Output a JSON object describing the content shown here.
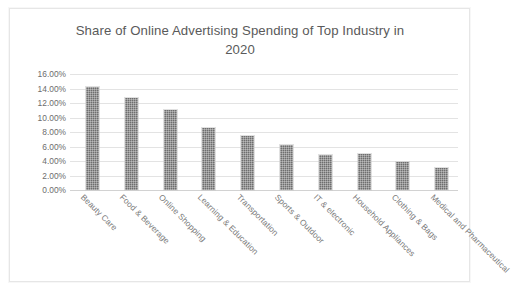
{
  "chart_data": {
    "type": "bar",
    "title": "Share of Online Advertising Spending of Top Industry in 2020",
    "title_line1": "Share of Online Advertising Spending of Top Industry in",
    "title_line2": "2020",
    "xlabel": "",
    "ylabel": "",
    "ylim": [
      0,
      16
    ],
    "ytick_labels": [
      "16.00%",
      "14.00%",
      "12.00%",
      "10.00%",
      "8.00%",
      "6.00%",
      "4.00%",
      "2.00%",
      "0.00%"
    ],
    "ytick_values": [
      16,
      14,
      12,
      10,
      8,
      6,
      4,
      2,
      0
    ],
    "grid": true,
    "legend": "none",
    "bar_color": "#6e6e6e",
    "categories": [
      "Beauty Care",
      "Food & Beverage",
      "Online Shopping",
      "Learning & Education",
      "Transportation",
      "Sports & Outdoor",
      "IT & electronic",
      "Household Appliances",
      "Clothing & Bags",
      "Medical and Pharmaceutical"
    ],
    "values": [
      14.2,
      12.7,
      11.1,
      8.6,
      7.5,
      6.2,
      4.8,
      4.9,
      3.8,
      3.0
    ]
  }
}
